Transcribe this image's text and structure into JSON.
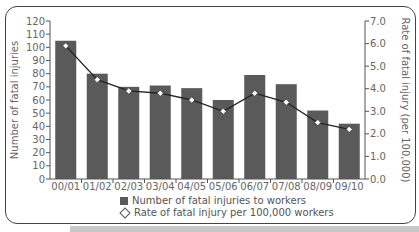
{
  "chart_data": {
    "type": "bar",
    "combo": "bar+line (dual axis)",
    "categories": [
      "00/01",
      "01/02",
      "02/03",
      "03/04",
      "04/05",
      "05/06",
      "06/07",
      "07/08",
      "08/09",
      "09/10"
    ],
    "series": [
      {
        "name": "Number of fatal injuries to workers",
        "type": "bar",
        "axis": "left",
        "color": "#5a5a5a",
        "values": [
          105,
          80,
          70,
          71,
          69,
          60,
          79,
          72,
          52,
          42
        ]
      },
      {
        "name": "Rate of fatal injury per 100,000 workers",
        "type": "line",
        "axis": "right",
        "color": "#222222",
        "marker": "diamond",
        "values": [
          5.9,
          4.4,
          3.9,
          3.8,
          3.5,
          3.0,
          3.8,
          3.4,
          2.5,
          2.2
        ]
      }
    ],
    "title": "",
    "xlabel": "",
    "ylabel": "Number of fatal injuries",
    "y2label": "Rate of fatal injury (per 100,000)",
    "ylim": [
      0,
      120
    ],
    "y2lim": [
      0,
      7.0
    ],
    "yticks": [
      "0",
      "10",
      "20",
      "30",
      "40",
      "50",
      "60",
      "70",
      "80",
      "90",
      "100",
      "110",
      "120"
    ],
    "y2ticks": [
      "0.0",
      "1.0",
      "2.0",
      "3.0",
      "4.0",
      "5.0",
      "6.0",
      "7.0"
    ],
    "grid": false,
    "legend_position": "bottom",
    "legend": [
      "Number of fatal injuries to workers",
      "Rate of fatal injury per 100,000 workers"
    ]
  }
}
